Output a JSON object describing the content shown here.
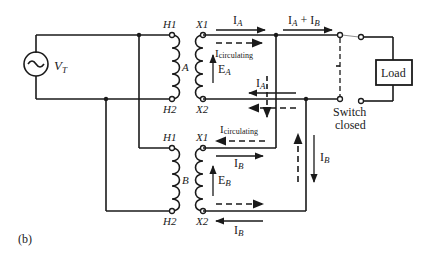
{
  "figure": {
    "caption": "(b)"
  },
  "source": {
    "label_main": "V",
    "label_sub": "T"
  },
  "transformers": [
    {
      "name": "A",
      "h1": "H1",
      "h2": "H2",
      "x1": "X1",
      "x2": "X2",
      "emf_label_main": "E",
      "emf_label_sub": "A"
    },
    {
      "name": "B",
      "h1": "H1",
      "h2": "H2",
      "x1": "X1",
      "x2": "X2",
      "emf_label_main": "E",
      "emf_label_sub": "B"
    }
  ],
  "currents": {
    "ia_main": "I",
    "ia_sub": "A",
    "ib_main": "I",
    "ib_sub": "B",
    "sum_main_a": "I",
    "sum_sub_a": "A",
    "sum_plus": " + I",
    "sum_sub_b": "B",
    "circulating_main": "I",
    "circulating_sub": "circulating"
  },
  "load": {
    "label": "Load"
  },
  "switch": {
    "line1": "Switch",
    "line2": "closed"
  }
}
